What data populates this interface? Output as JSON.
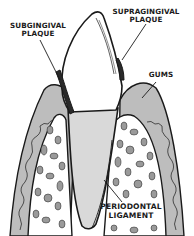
{
  "diagram": {
    "labels": {
      "subgingival_plaque": {
        "line1": "SUBGINGIVAL",
        "line2": "PLAQUE"
      },
      "supragingival_plaque": {
        "line1": "SUPRAGINGIVAL",
        "line2": "PLAQUE"
      },
      "gums": "GUMS",
      "periodontal_ligament": {
        "line1": "PERIODONTAL",
        "line2": "LIGAMENT"
      }
    },
    "colors": {
      "background": "#ffffff",
      "ink": "#1a1a1a",
      "gum_tissue": "#bdbdbd",
      "root": "#d9d9d9",
      "crown": "#ffffff",
      "bone_fill": "#ffffff",
      "bone_cells": "#9a9a9a"
    }
  }
}
